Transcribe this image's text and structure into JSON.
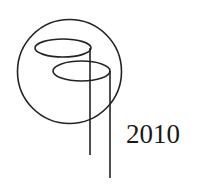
{
  "diagram": {
    "year_label": "2010",
    "stroke_color": "#222222",
    "background": "#ffffff",
    "shapes": {
      "outer_circle": {
        "cx": 69.5,
        "cy": 71.5,
        "r": 52
      },
      "upper_ellipse": {
        "cx": 63,
        "cy": 48,
        "rx": 28,
        "ry": 9
      },
      "lower_ellipse": {
        "cx": 81.5,
        "cy": 71,
        "rx": 28.5,
        "ry": 10
      },
      "stem_left": {
        "x": 90,
        "y1": 48,
        "y2": 155
      },
      "stem_right": {
        "x": 110,
        "y1": 71,
        "y2": 178
      }
    }
  }
}
